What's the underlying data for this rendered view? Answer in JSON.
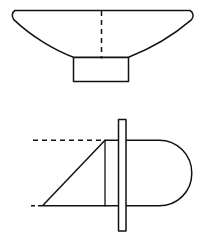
{
  "document": {
    "title": "Two-view line drawing",
    "description": "Engineering line drawing with an upper front/section view and a lower plan view",
    "background_color": "#ffffff",
    "line_color": "#121212",
    "canvas": {
      "width": 206,
      "height": 236
    }
  },
  "views": {
    "upper": {
      "name": "front-section-view",
      "label": "",
      "hull_outline": {
        "top_edge": {
          "x1": 14,
          "y1": 11,
          "x2": 191,
          "y2": 11
        },
        "left_cap_end": {
          "x": 13,
          "y": 19
        },
        "right_cap_end": {
          "x": 192,
          "y": 19
        },
        "keel_left": {
          "x": 73,
          "y": 58
        },
        "keel_right": {
          "x": 128,
          "y": 58
        },
        "path": "M14,11 L191,11 C194,13 194,17 192,20 C170,36 146,50 128,57 L73,57 C53,50 30,36 14,20 C11,17 11,13 14,11 Z"
      },
      "centerline": {
        "name": "vertical-centerline",
        "style": "dashed",
        "x": 101,
        "y_top": 11,
        "y_bottom": 59
      },
      "skeg_box": {
        "name": "skeg-box",
        "x": 73,
        "y": 57,
        "width": 55,
        "height": 24
      }
    },
    "lower": {
      "name": "plan-view",
      "label": "",
      "top_reference_line": {
        "name": "upper-datum-line",
        "style": "dashed",
        "x1": 33,
        "y1": 140,
        "x2": 105,
        "y2": 140
      },
      "bottom_reference_stub": {
        "name": "lower-datum-stub",
        "style": "dashed",
        "x1": 31,
        "y1": 206,
        "x2": 43,
        "y2": 206
      },
      "hull_plan": {
        "top_edge": {
          "x1": 105,
          "y1": 140,
          "x2": 162,
          "y2": 140
        },
        "bottom_edge": {
          "x1": 42,
          "y1": 206,
          "x2": 162,
          "y2": 206
        },
        "stern_cap_radius": 33,
        "stern_cap_center": {
          "x": 159,
          "y": 173
        },
        "bow_diagonal": {
          "x1": 105,
          "y1": 140,
          "x2": 42,
          "y2": 206
        },
        "bow_vertical": {
          "x": 105,
          "y1": 140,
          "y2": 206
        },
        "path": "M105,140 L160,140 C178,140 192,155 192,173 C192,191 178,206 160,206 L42,206 L105,140 Z"
      },
      "fin_bar": {
        "name": "vertical-fin-bar",
        "x": 118,
        "y": 119,
        "width": 8,
        "height": 112
      }
    }
  }
}
